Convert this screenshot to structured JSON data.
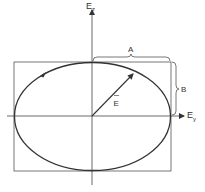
{
  "diagram": {
    "type": "elliptical-polarization",
    "axes": {
      "vertical": {
        "label": "E",
        "subscript": "z"
      },
      "horizontal": {
        "label": "E",
        "subscript": "y"
      }
    },
    "vector_label": "E",
    "dimension_labels": {
      "half_width": "A",
      "half_height": "B"
    },
    "colors": {
      "line": "#333333",
      "background": "#ffffff"
    }
  }
}
